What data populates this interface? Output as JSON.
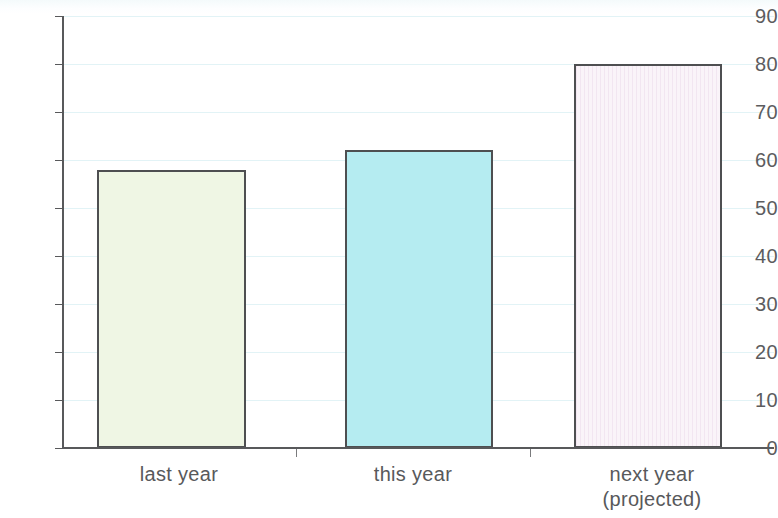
{
  "chart_data": {
    "type": "bar",
    "title": "",
    "subtitle": "",
    "xlabel": "",
    "ylabel": "",
    "categories": [
      "last year",
      "this year",
      "next year\n(projected)"
    ],
    "category_lines": [
      [
        "last year"
      ],
      [
        "this year"
      ],
      [
        "next year",
        "(projected)"
      ]
    ],
    "values": [
      58,
      62,
      80
    ],
    "ylim": [
      0,
      90
    ],
    "ytick_labels": [
      "0",
      "10",
      "20",
      "30",
      "40",
      "50",
      "60",
      "70",
      "80",
      "90"
    ],
    "ytick_values": [
      0,
      10,
      20,
      30,
      40,
      50,
      60,
      70,
      80,
      90
    ],
    "grid": true,
    "grid_axis": "y",
    "legend": false,
    "legend_position": "none",
    "bar_colors": [
      "#eff6e4",
      "#b5ecf1",
      "#f6eef5"
    ],
    "bar_border_color": "#4e4f51",
    "gridline_color": "#e2f3f6",
    "axis_color": "#58595b",
    "text_color": "#58595b",
    "background_color": "#ffffff"
  },
  "axes": {
    "y_ticks": [
      {
        "label": "90",
        "value": 90
      },
      {
        "label": "80",
        "value": 80
      },
      {
        "label": "70",
        "value": 70
      },
      {
        "label": "60",
        "value": 60
      },
      {
        "label": "50",
        "value": 50
      },
      {
        "label": "40",
        "value": 40
      },
      {
        "label": "30",
        "value": 30
      },
      {
        "label": "20",
        "value": 20
      },
      {
        "label": "10",
        "value": 10
      },
      {
        "label": "0",
        "value": 0
      }
    ]
  },
  "bars": [
    {
      "label": "last year",
      "value": 58,
      "color": "#eff6e4"
    },
    {
      "label": "this year",
      "value": 62,
      "color": "#b5ecf1"
    },
    {
      "label": "next year (projected)",
      "value": 80,
      "color": "#f6eef5"
    }
  ]
}
